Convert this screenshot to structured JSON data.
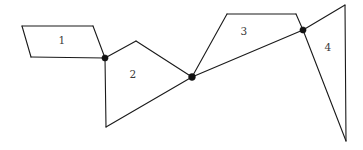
{
  "diagram": {
    "canvas": {
      "width": 363,
      "height": 150,
      "background": "#ffffff"
    },
    "style": {
      "line_color": "#1a1a1a",
      "line_width": 1.1,
      "node_color": "#121212",
      "node_radius": 3.1,
      "label_color": "#3a3a3a",
      "label_font_size": 10.5
    },
    "regions": [
      {
        "id": "region-1",
        "label": "1",
        "shape": "parallelogram",
        "label_x": 62,
        "label_y": 41,
        "points": "22,26 93,26 105,58 31,57"
      },
      {
        "id": "region-2",
        "label": "2",
        "shape": "quadrilateral",
        "label_x": 133,
        "label_y": 75,
        "points": "105,58 136,41 192,77 106,127"
      },
      {
        "id": "region-3",
        "label": "3",
        "shape": "quadrilateral",
        "label_x": 244,
        "label_y": 32,
        "points": "192,77 227,14 296,14 303,30"
      },
      {
        "id": "region-4",
        "label": "4",
        "shape": "triangle",
        "label_x": 328,
        "label_y": 48,
        "points": "303,30 345,5 346,141"
      }
    ],
    "edges": [
      {
        "id": "edge-r1-top",
        "name": "region-1-top-edge",
        "d": "M 22,26 L 93,26"
      },
      {
        "id": "edge-r1-left",
        "name": "region-1-left-edge",
        "d": "M 22,26 L 31,57"
      },
      {
        "id": "edge-r1-bottom",
        "name": "region-1-bottom-edge",
        "d": "M 31,57 L 105,58"
      },
      {
        "id": "edge-r1-right",
        "name": "region-1-right-edge",
        "d": "M 93,26 L 105,58"
      },
      {
        "id": "edge-r2-upper-left",
        "name": "region-2-upper-left-edge",
        "d": "M 105,58 L 136,41"
      },
      {
        "id": "edge-r2-upper-right",
        "name": "region-2-upper-right-edge",
        "d": "M 136,41 L 192,77"
      },
      {
        "id": "edge-r2-left",
        "name": "region-2-left-edge",
        "d": "M 105,58 L 106,127"
      },
      {
        "id": "edge-diagonal",
        "name": "long-diagonal-edge",
        "d": "M 106,127 L 192,77 L 303,30"
      },
      {
        "id": "edge-r3-left",
        "name": "region-3-left-edge",
        "d": "M 192,77 L 227,14"
      },
      {
        "id": "edge-r3-top",
        "name": "region-3-top-edge",
        "d": "M 227,14 L 296,14"
      },
      {
        "id": "edge-r3-right",
        "name": "region-3-right-edge",
        "d": "M 296,14 L 303,30"
      },
      {
        "id": "edge-r4-top",
        "name": "region-4-top-edge",
        "d": "M 303,30 L 345,5"
      },
      {
        "id": "edge-r4-right",
        "name": "region-4-right-edge",
        "d": "M 345,5 L 346,141"
      },
      {
        "id": "edge-r4-left",
        "name": "region-4-left-edge",
        "d": "M 303,30 L 346,141"
      }
    ],
    "nodes": [
      {
        "id": "node-a",
        "name": "vertex-node-left",
        "x": 105,
        "y": 58
      },
      {
        "id": "node-b",
        "name": "vertex-node-center",
        "x": 192,
        "y": 77
      },
      {
        "id": "node-c",
        "name": "vertex-node-right",
        "x": 303,
        "y": 30
      }
    ]
  }
}
